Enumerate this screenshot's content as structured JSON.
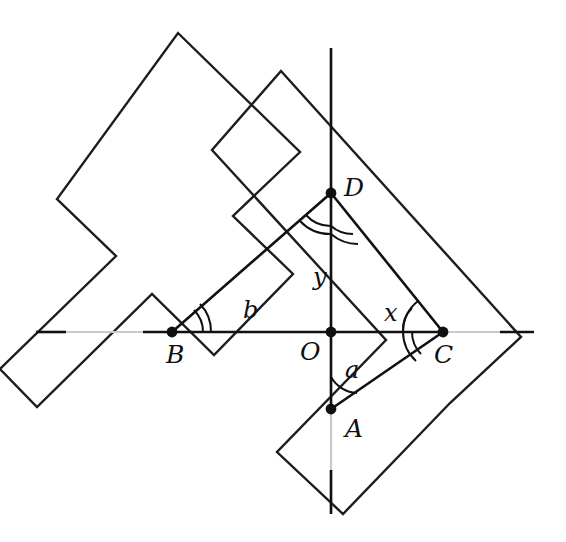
{
  "figure": {
    "background_color": "#ffffff",
    "stroke_color": "#101012",
    "faint_color": "#c9c9c9",
    "width": 566,
    "height": 542
  },
  "points": [
    {
      "id": "A",
      "label": "A",
      "x": 331,
      "y": 409,
      "label_x": 345,
      "label_y": 437
    },
    {
      "id": "B",
      "label": "B",
      "x": 172,
      "y": 332,
      "label_x": 166,
      "label_y": 363
    },
    {
      "id": "C",
      "label": "C",
      "x": 443,
      "y": 332,
      "label_x": 434,
      "label_y": 363
    },
    {
      "id": "D",
      "label": "D",
      "x": 331,
      "y": 193,
      "label_x": 344,
      "label_y": 196
    },
    {
      "id": "O",
      "label": "O",
      "x": 331,
      "y": 332,
      "label_x": 300,
      "label_y": 360
    }
  ],
  "segment_labels": [
    {
      "id": "a",
      "label": "a",
      "x": 345,
      "y": 378
    },
    {
      "id": "b",
      "label": "b",
      "x": 243,
      "y": 318
    },
    {
      "id": "x",
      "label": "x",
      "x": 384,
      "y": 321
    },
    {
      "id": "y",
      "label": "y",
      "x": 313,
      "y": 285
    }
  ],
  "axes": {
    "horizontal": {
      "x1": 36,
      "y1": 332,
      "x2": 534,
      "y2": 332
    },
    "vertical": {
      "x1": 331,
      "y1": 48,
      "x2": 331,
      "y2": 514
    }
  },
  "angle_marks": [
    {
      "vertex": "A",
      "arcs": 1,
      "description": "angle at A between ray to O and ray to C"
    },
    {
      "vertex": "B",
      "arcs": 2,
      "description": "angle at B between ray to O and ray to D"
    },
    {
      "vertex": "C",
      "arcs": 2,
      "description": "angle at C between ray to O and ray to D"
    },
    {
      "vertex": "D",
      "arcs": 2,
      "description": "angles at D split by segment DO"
    }
  ],
  "rulers": [
    {
      "id": "left-square",
      "description": "L-shaped carpenter square, corner lower-right, arms up-right and down-left"
    },
    {
      "id": "right-square",
      "description": "L-shaped carpenter square, corner at right, arms up-left and down-left"
    }
  ]
}
